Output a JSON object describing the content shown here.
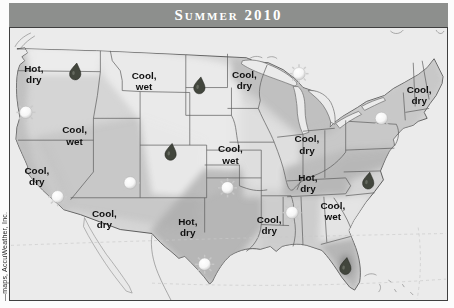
{
  "header": {
    "title": "Summer 2010"
  },
  "attribution": "—maps, AccuWeather, Inc.",
  "map": {
    "colors": {
      "banner_bg": "#8d8f8d",
      "banner_text": "#ffffff",
      "frame_border": "#3f3f3f",
      "water_bg": "#ebebeb",
      "land": "#d5d5d5",
      "shade_dark": "#a8a8a8",
      "shade_light": "#ececec",
      "label_text": "#101010",
      "sun_fill": "#ffffff",
      "raindrop_fill": "#42463d"
    },
    "labels": [
      {
        "id": "pacific-northwest",
        "line1": "Hot,",
        "line2": "dry",
        "x": 33,
        "y": 71
      },
      {
        "id": "northern-rockies",
        "line1": "Cool,",
        "line2": "wet",
        "x": 144,
        "y": 78
      },
      {
        "id": "great-basin",
        "line1": "Cool,",
        "line2": "wet",
        "x": 74,
        "y": 133
      },
      {
        "id": "california",
        "line1": "Cool,",
        "line2": "dry",
        "x": 36,
        "y": 174
      },
      {
        "id": "southwest",
        "line1": "Cool,",
        "line2": "dry",
        "x": 104,
        "y": 217
      },
      {
        "id": "upper-midwest",
        "line1": "Cool,",
        "line2": "dry",
        "x": 245,
        "y": 77
      },
      {
        "id": "central-plains",
        "line1": "Cool,",
        "line2": "wet",
        "x": 231,
        "y": 152
      },
      {
        "id": "texas",
        "line1": "Hot,",
        "line2": "dry",
        "x": 188,
        "y": 225
      },
      {
        "id": "gulf-coast",
        "line1": "Cool,",
        "line2": "dry",
        "x": 270,
        "y": 223
      },
      {
        "id": "ohio-valley",
        "line1": "Cool,",
        "line2": "dry",
        "x": 308,
        "y": 142
      },
      {
        "id": "tennessee-valley",
        "line1": "Hot,",
        "line2": "dry",
        "x": 309,
        "y": 181
      },
      {
        "id": "southeast",
        "line1": "Cool,",
        "line2": "wet",
        "x": 334,
        "y": 209
      },
      {
        "id": "northeast",
        "line1": "Cool,",
        "line2": "dry",
        "x": 421,
        "y": 92
      }
    ],
    "sun_icons": [
      {
        "x": 25,
        "y": 112
      },
      {
        "x": 57,
        "y": 197
      },
      {
        "x": 130,
        "y": 183
      },
      {
        "x": 228,
        "y": 188
      },
      {
        "x": 205,
        "y": 265
      },
      {
        "x": 293,
        "y": 213
      },
      {
        "x": 300,
        "y": 73
      },
      {
        "x": 383,
        "y": 118
      }
    ],
    "raindrop_icons": [
      {
        "x": 75,
        "y": 71
      },
      {
        "x": 200,
        "y": 85
      },
      {
        "x": 171,
        "y": 152
      },
      {
        "x": 370,
        "y": 181
      },
      {
        "x": 347,
        "y": 267
      }
    ]
  }
}
